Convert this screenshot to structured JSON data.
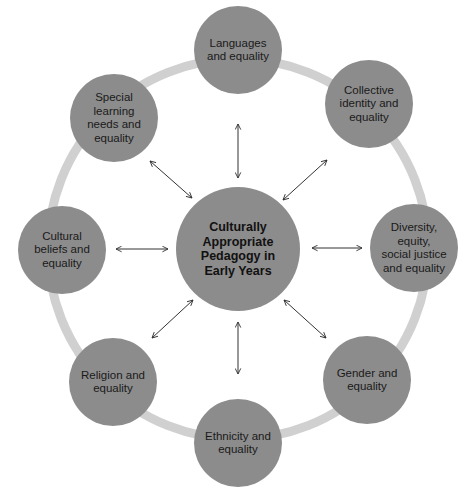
{
  "diagram": {
    "colors": {
      "node_fill": "#8c8c8c",
      "ring": "#d0d0d0",
      "arrow": "#333333",
      "text": "#1a1a1a"
    },
    "center": {
      "label": "Culturally Appropriate Pedagogy in Early Years",
      "lines": [
        "Culturally",
        "Appropriate",
        "Pedagogy in",
        "Early Years"
      ],
      "cx": 238,
      "cy": 249,
      "r": 62
    },
    "ring": {
      "cx": 238,
      "cy": 249,
      "r": 190,
      "width": 9
    },
    "nodes": [
      {
        "id": "languages",
        "label": "Languages and equality",
        "lines": [
          "Languages",
          "and equality"
        ],
        "cx": 238,
        "cy": 50
      },
      {
        "id": "collective",
        "label": "Collective identity and equality",
        "lines": [
          "Collective",
          "identity and",
          "equality"
        ],
        "cx": 369,
        "cy": 104
      },
      {
        "id": "diversity",
        "label": "Diversity, equity, social justice and equality",
        "lines": [
          "Diversity,",
          "equity,",
          "social justice",
          "and equality"
        ],
        "cx": 414,
        "cy": 248
      },
      {
        "id": "gender",
        "label": "Gender and equality",
        "lines": [
          "Gender and",
          "equality"
        ],
        "cx": 367,
        "cy": 380
      },
      {
        "id": "ethnicity",
        "label": "Ethnicity and equality",
        "lines": [
          "Ethnicity and",
          "equality"
        ],
        "cx": 238,
        "cy": 443
      },
      {
        "id": "religion",
        "label": "Religion and equality",
        "lines": [
          "Religion and",
          "equality"
        ],
        "cx": 113,
        "cy": 382
      },
      {
        "id": "cultural",
        "label": "Cultural beliefs and equality",
        "lines": [
          "Cultural",
          "beliefs and",
          "equality"
        ],
        "cx": 62,
        "cy": 250
      },
      {
        "id": "special",
        "label": "Special learning needs and equality",
        "lines": [
          "Special",
          "learning",
          "needs and",
          "equality"
        ],
        "cx": 114,
        "cy": 118
      }
    ],
    "node_radius": 44,
    "arrows": [
      {
        "to": "languages",
        "x1": 238,
        "y1": 178,
        "x2": 238,
        "y2": 124
      },
      {
        "to": "collective",
        "x1": 283,
        "y1": 200,
        "x2": 327,
        "y2": 160
      },
      {
        "to": "diversity",
        "x1": 312,
        "y1": 248,
        "x2": 362,
        "y2": 248
      },
      {
        "to": "gender",
        "x1": 284,
        "y1": 300,
        "x2": 326,
        "y2": 338
      },
      {
        "to": "ethnicity",
        "x1": 238,
        "y1": 322,
        "x2": 238,
        "y2": 374
      },
      {
        "to": "religion",
        "x1": 193,
        "y1": 300,
        "x2": 152,
        "y2": 338
      },
      {
        "to": "cultural",
        "x1": 168,
        "y1": 249,
        "x2": 116,
        "y2": 249
      },
      {
        "to": "special",
        "x1": 192,
        "y1": 198,
        "x2": 150,
        "y2": 161
      }
    ]
  }
}
